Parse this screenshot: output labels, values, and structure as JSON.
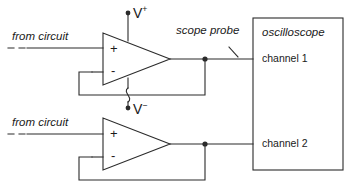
{
  "diagram": {
    "title_text": "oscilloscope",
    "labels": {
      "from_circuit_top": "from circuit",
      "from_circuit_bottom": "from circuit",
      "v_plus_base": "V",
      "v_plus_sup": "+",
      "v_minus_base": "V",
      "v_minus_sup": "−",
      "scope_probe": "scope probe",
      "oscilloscope": "oscilloscope",
      "channel_1": "channel 1",
      "channel_2": "channel 2",
      "opamp1_plus": "+",
      "opamp1_minus": "-",
      "opamp2_plus": "+",
      "opamp2_minus": "-"
    },
    "icons": {
      "opamp_top": "opamp-triangle-icon",
      "opamp_bottom": "opamp-triangle-icon",
      "node_top": "junction-dot-icon",
      "node_bottom": "junction-dot-icon",
      "vplus_terminal": "terminal-dot-icon",
      "vminus_terminal": "terminal-dot-icon",
      "wire_hop": "wire-crossover-hop-icon",
      "probe_leader": "leader-line-icon"
    },
    "colors": {
      "stroke": "#2b2b2b",
      "text": "#1a1a1a",
      "background": "#ffffff"
    },
    "geometry": {
      "stroke_width": 1.1,
      "opamp_top": {
        "x1": 103,
        "y1": 33,
        "x2": 170,
        "y2": 85
      },
      "opamp_bottom": {
        "x1": 103,
        "y1": 118,
        "x2": 170,
        "y2": 170
      },
      "scope_box": {
        "x": 253,
        "y": 18,
        "w": 90,
        "h": 152
      },
      "node_top": {
        "cx": 205,
        "cy": 60
      },
      "node_bottom": {
        "cx": 205,
        "cy": 145
      }
    }
  }
}
